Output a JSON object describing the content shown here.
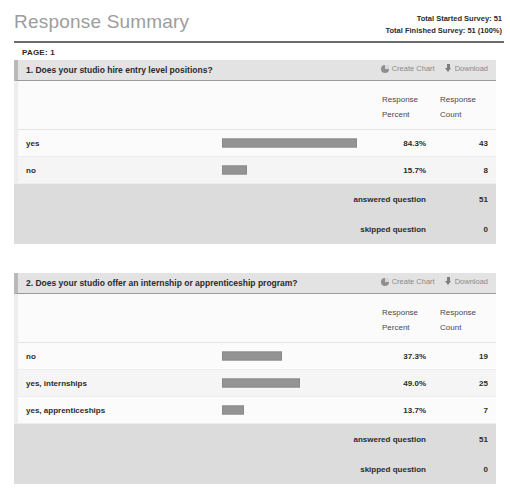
{
  "header": {
    "title": "Response Summary",
    "total_started_label": "Total Started Survey: 51",
    "total_finished_label": "Total Finished Survey: 51  (100%)",
    "page_label": "PAGE: 1"
  },
  "actions": {
    "create_chart": "Create Chart",
    "download": "Download",
    "create_chart_icon": "pie-chart-icon",
    "download_icon": "download-arrow-icon"
  },
  "columns": {
    "percent_line1": "Response",
    "percent_line2": "Percent",
    "count_line1": "Response",
    "count_line2": "Count"
  },
  "summary_labels": {
    "answered": "answered question",
    "skipped": "skipped question"
  },
  "colors": {
    "bar": "#949494",
    "header_band": "#e3e3e3",
    "footer_band": "#dcdcdc",
    "title": "#9d9d9d"
  },
  "chart_data": [
    {
      "type": "bar",
      "title": "1. Does your studio hire entry level positions?",
      "number": "1.",
      "categories": [
        "yes",
        "no"
      ],
      "values": [
        84.3,
        15.7
      ],
      "counts": [
        43,
        8
      ],
      "percent_labels": [
        "84.3%",
        "15.7%"
      ],
      "count_labels": [
        "43",
        "8"
      ],
      "answered": "51",
      "skipped": "0",
      "xlabel": "",
      "ylabel": "Response Percent",
      "xlim": [
        0,
        100
      ],
      "grid": false,
      "legend": "none",
      "orientation": "horizontal"
    },
    {
      "type": "bar",
      "title": "2. Does your studio offer an internship or apprenticeship program?",
      "number": "2.",
      "categories": [
        "no",
        "yes, internships",
        "yes, apprenticeships"
      ],
      "values": [
        37.3,
        49.0,
        13.7
      ],
      "counts": [
        19,
        25,
        7
      ],
      "percent_labels": [
        "37.3%",
        "49.0%",
        "13.7%"
      ],
      "count_labels": [
        "19",
        "25",
        "7"
      ],
      "answered": "51",
      "skipped": "0",
      "xlabel": "",
      "ylabel": "Response Percent",
      "xlim": [
        0,
        100
      ],
      "grid": false,
      "legend": "none",
      "orientation": "horizontal"
    }
  ]
}
